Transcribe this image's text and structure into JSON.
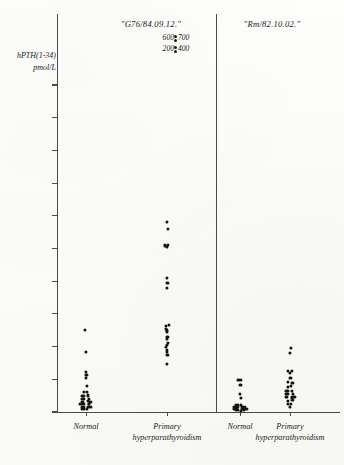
{
  "figure": {
    "y_axis_title_line1": "hPTH(1-34)",
    "y_axis_title_line2": "pmol/L",
    "panels": [
      {
        "title": "\"G76/84.09.12.\""
      },
      {
        "title": "\"Rm/82.10.02.\""
      }
    ],
    "categories": [
      {
        "line1": "Normal",
        "line2": ""
      },
      {
        "line1": "Primary",
        "line2": "hyperparathyroidism"
      },
      {
        "line1": "Normal",
        "line2": ""
      },
      {
        "line1": "Primary",
        "line2": "hyperparathyroidism"
      }
    ],
    "offscale_annotations": [
      {
        "left": "600",
        "right": "700"
      },
      {
        "left": "200",
        "right": "400"
      }
    ],
    "colors": {
      "axis": "#4a4a4a",
      "marker": "#141414",
      "paper": "#fdfdfb",
      "text": "#222222"
    }
  },
  "chart_data": {
    "type": "scatter",
    "xlabel": "",
    "ylabel": "hPTH(1-34) pmol/L",
    "ylim": [
      0,
      105
    ],
    "yticks": [
      0,
      10,
      20,
      30,
      40,
      50,
      60,
      70,
      80,
      90,
      100
    ],
    "ytick_labels": [
      "0",
      "10",
      "20",
      "30",
      "40",
      "50",
      "60",
      "70",
      "80",
      "90",
      "100"
    ],
    "grid": false,
    "legend": "none",
    "panels": [
      {
        "name": "\"G76/84.09.12.\"",
        "groups": [
          {
            "name": "Normal",
            "x_center": 86,
            "values": [
              25.0,
              18.5,
              12.2,
              11.3,
              10.3,
              8.0,
              6.2,
              6.2,
              5.0,
              5.0,
              5.0,
              4.0,
              4.0,
              4.0,
              3.2,
              3.2,
              3.2,
              3.2,
              2.4,
              2.4,
              2.4,
              2.4,
              2.4,
              1.6,
              1.6,
              1.6,
              1.6,
              0.9,
              0.9,
              0.9
            ]
          },
          {
            "name": "Primary hyperparathyroidism",
            "x_center": 167,
            "values": [
              58.0,
              56.0,
              51.0,
              51.0,
              50.5,
              41.0,
              39.5,
              38.0,
              26.5,
              26.5,
              25.5,
              25.0,
              24.5,
              23.0,
              22.5,
              21.0,
              20.5,
              20.0,
              19.0,
              18.5,
              17.5,
              14.5
            ]
          }
        ]
      },
      {
        "name": "\"Rm/82.10.02.\"",
        "groups": [
          {
            "name": "Normal",
            "x_center": 240,
            "values": [
              9.8,
              9.8,
              8.2,
              5.5,
              4.3,
              2.2,
              2.2,
              2.2,
              1.5,
              1.5,
              1.5,
              1.5,
              1.5,
              0.9,
              0.9,
              0.9,
              0.9,
              0.9,
              0.9,
              0.5,
              0.5,
              0.5,
              0.5
            ]
          },
          {
            "name": "Primary hyperparathyroidism",
            "x_center": 290,
            "values": [
              19.5,
              18.0,
              12.5,
              12.5,
              12.0,
              10.5,
              9.0,
              9.0,
              7.8,
              7.8,
              6.5,
              6.5,
              6.5,
              5.5,
              5.5,
              5.5,
              4.5,
              4.5,
              4.5,
              4.5,
              3.5,
              3.5,
              2.5,
              2.5,
              1.5
            ]
          }
        ]
      }
    ],
    "offscale_points": [
      200,
      400,
      600,
      700
    ]
  }
}
